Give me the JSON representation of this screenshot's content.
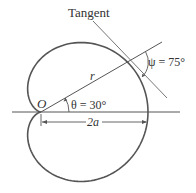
{
  "diagram": {
    "type": "cardioid",
    "equation": "r = a(1 + cos θ)",
    "labels": {
      "tangent": "Tangent",
      "radius": "r",
      "origin": "O",
      "theta": "θ = 30°",
      "psi": "ψ = 75°",
      "diameter": "2a"
    },
    "values": {
      "theta_deg": 30,
      "psi_deg": 75
    },
    "colors": {
      "curve": "#555555",
      "lines": "#666666",
      "text": "#333333"
    }
  }
}
